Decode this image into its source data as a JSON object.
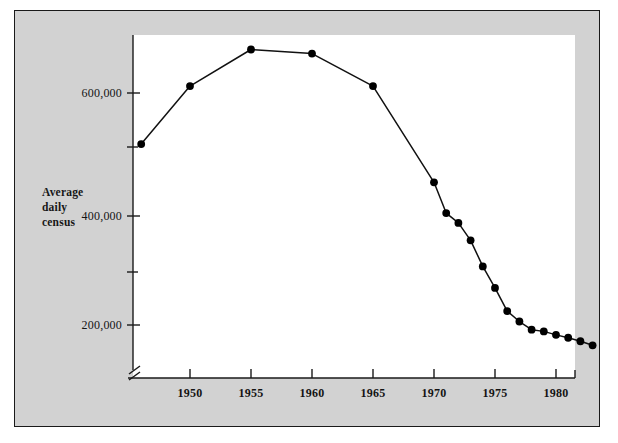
{
  "chart_data": {
    "type": "line",
    "title": "",
    "subtitle": "",
    "xlabel": "",
    "ylabel": "Average daily census",
    "ylabel_lines": [
      "Average",
      "daily",
      "census"
    ],
    "x": [
      1946,
      1950,
      1955,
      1960,
      1965,
      1970,
      1971,
      1972,
      1973,
      1974,
      1975,
      1976,
      1977,
      1978,
      1979,
      1980,
      1981,
      1982,
      1983
    ],
    "values": [
      512000,
      612000,
      675000,
      668000,
      612000,
      446000,
      393000,
      376000,
      346000,
      301000,
      264000,
      224000,
      206000,
      192000,
      189000,
      183000,
      178000,
      172000,
      165000
    ],
    "series": [
      {
        "name": "Average daily census",
        "x": [
          1946,
          1950,
          1955,
          1960,
          1965,
          1970,
          1971,
          1972,
          1973,
          1974,
          1975,
          1976,
          1977,
          1978,
          1979,
          1980,
          1981,
          1982,
          1983
        ],
        "values": [
          512000,
          612000,
          675000,
          668000,
          612000,
          446000,
          393000,
          376000,
          346000,
          301000,
          264000,
          224000,
          206000,
          192000,
          189000,
          183000,
          178000,
          172000,
          165000
        ]
      }
    ],
    "xlim": [
      1945,
      1984
    ],
    "ylim": [
      140000,
      700000
    ],
    "x_tick_labels": [
      "1950",
      "1955",
      "1960",
      "1965",
      "1970",
      "1975",
      "1980"
    ],
    "x_tick_values": [
      1950,
      1955,
      1960,
      1965,
      1970,
      1975,
      1980
    ],
    "y_tick_labels": [
      "200,000",
      "400,000",
      "600,000"
    ],
    "y_tick_values": [
      200000,
      400000,
      600000
    ],
    "y_minor_tick_values": [
      300000,
      500000
    ],
    "grid": false,
    "legend": false,
    "legend_position": "none",
    "marker": "filled-circle",
    "line_color": "#000000",
    "marker_color": "#000000",
    "axis_break": "x-axis-origin",
    "background_color": "#d2d2d2",
    "plot_background_color": "#ffffff"
  },
  "figure": {
    "border_color": "#1a1a1a",
    "field_color": "#d2d2d2"
  }
}
